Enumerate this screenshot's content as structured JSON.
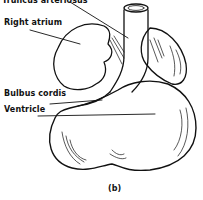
{
  "figure": {
    "caption": "(b)"
  },
  "labels": [
    {
      "id": "truncus",
      "text": "Truncus arteriosus"
    },
    {
      "id": "atrium",
      "text": "Right atrium"
    },
    {
      "id": "bulbus",
      "text": "Bulbus cordis"
    },
    {
      "id": "ventricle",
      "text": "Ventricle"
    }
  ],
  "colors": {
    "ink": "#111111",
    "background": "#ffffff"
  }
}
